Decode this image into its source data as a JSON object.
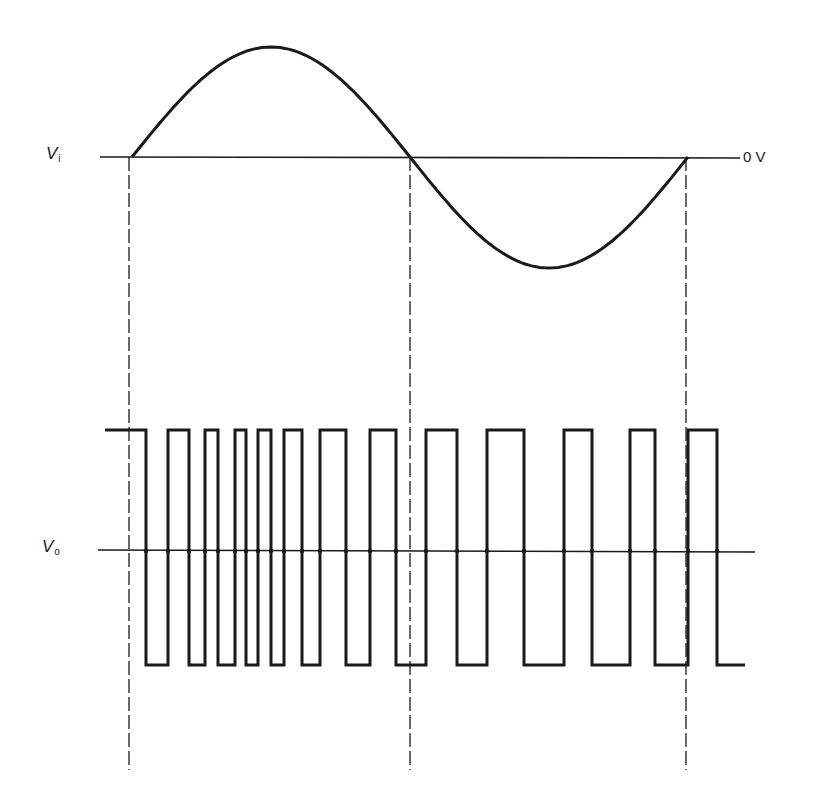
{
  "chart_data": {
    "type": "line",
    "title": "",
    "colors": {
      "stroke": "#1a1a1a",
      "background": "#ffffff"
    },
    "series": [
      {
        "name": "Vi",
        "label": "V",
        "subscript": "i",
        "kind": "sine",
        "axis_y": 157,
        "x_start": 132,
        "x_end": 688,
        "amplitude_up": 110,
        "amplitude_down": 111,
        "zero_crossings_x": [
          132,
          410,
          688
        ],
        "reference_label": "0 V"
      },
      {
        "name": "Vo",
        "label": "V",
        "subscript": "o",
        "kind": "square",
        "axis_y": 550,
        "axis_x_start": 98,
        "axis_x_end": 755,
        "high_y": 430,
        "low_y": 665,
        "start_x": 105,
        "start_level": "high",
        "end_x": 745,
        "transitions_x": [
          146,
          168,
          189,
          205,
          218,
          235,
          246,
          258,
          271,
          284,
          302,
          320,
          346,
          370,
          396,
          426,
          457,
          487,
          524,
          564,
          592,
          630,
          655,
          688,
          717
        ]
      }
    ],
    "markers": {
      "dashed_lines_x": [
        129,
        410,
        686
      ],
      "dashed_y_start": 157,
      "dashed_y_end": 770
    },
    "axes": {
      "vi_axis": {
        "x1": 100,
        "x2": 740,
        "y": 157
      },
      "vo_axis": {
        "x1": 98,
        "x2": 755,
        "y": 550
      }
    },
    "grid": false,
    "legend": "none"
  },
  "labels": {
    "vi": {
      "main": "V",
      "sub": "i"
    },
    "vo": {
      "main": "V",
      "sub": "o"
    },
    "zero_ref": "0 V"
  }
}
